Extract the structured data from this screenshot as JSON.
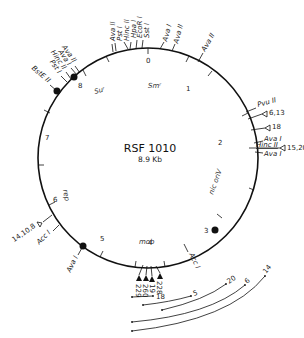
{
  "plasmid": {
    "name": "RSF 1010",
    "size": "8.9 Kb"
  },
  "scale_ticks": [
    "0",
    "1",
    "2",
    "3",
    "4",
    "5",
    "6",
    "7",
    "8"
  ],
  "genes": {
    "sm": "Smʳ",
    "su": "Suʳ",
    "nic_oriV": "nic oriV",
    "rep": "rep",
    "mob": "mob"
  },
  "sites": {
    "top_cluster": [
      "Ava II",
      "Pst I",
      "Hinc II",
      "Hpa I",
      "EcoR I",
      "Sst I"
    ],
    "top_right": [
      "Ava I",
      "Ava II",
      "Ava II"
    ],
    "left_cluster": [
      "Ava II",
      "Ava I",
      "Hinc II",
      "Pst I",
      "BstE II"
    ],
    "right_cluster": [
      "Pvu II",
      "Ava I",
      "Hinc II",
      "Ava I"
    ],
    "right_markers": [
      "6,13",
      "18",
      "15,20"
    ],
    "bottom_right": "Acc I",
    "bottom_left": [
      "Ava I",
      "Acc I"
    ],
    "left_marker": "14,10,8"
  },
  "insertions": [
    "229",
    "260",
    "19",
    "228"
  ],
  "deletion_labels": [
    "18",
    "5",
    "20",
    "6",
    "14"
  ]
}
